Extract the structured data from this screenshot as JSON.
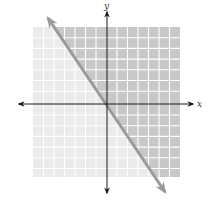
{
  "diagram": {
    "type": "linear-inequality-graph",
    "axes": {
      "x_label": "x",
      "y_label": "y"
    },
    "grid": {
      "cells_x": 14,
      "cells_y": 14,
      "light_fill": "#ebebeb",
      "dark_fill": "#c8c8c8",
      "grid_line_color": "#ffffff"
    },
    "boundary_line": {
      "style": "solid",
      "color": "#9a9a9a",
      "direction": "negative-slope"
    },
    "shaded_region": "right-of-line",
    "axis_color": "#1a1a1a"
  }
}
